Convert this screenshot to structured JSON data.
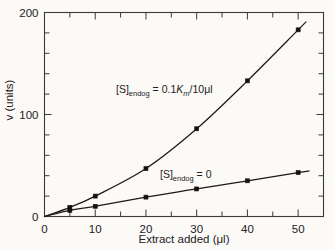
{
  "chart_data": {
    "type": "line",
    "title": "",
    "subtitle": "",
    "xlabel": "Extract added (μl)",
    "ylabel": "v (units)",
    "xlim": [
      0,
      55
    ],
    "ylim": [
      0,
      200
    ],
    "xticks": [
      0,
      10,
      20,
      30,
      40,
      50
    ],
    "xtick_labels": [
      "0",
      "10",
      "20",
      "30",
      "40",
      "50"
    ],
    "x_minor_tick_interval": 5,
    "yticks": [
      0,
      100,
      200
    ],
    "ytick_labels": [
      "0",
      "100",
      "200"
    ],
    "y_minor_tick_interval": 20,
    "grid": false,
    "legend": "none",
    "x": [
      0,
      5,
      10,
      20,
      30,
      40,
      50
    ],
    "series": [
      {
        "name": "[S]endog = 0.1Km/10ul",
        "annotation": "[S]endog = 0.1Km/10μl",
        "values": [
          0,
          9,
          20,
          47,
          86,
          133,
          183
        ],
        "marker": "square",
        "color": "#1c1a18"
      },
      {
        "name": "[S]endog = 0",
        "annotation": "[S]endog = 0",
        "values": [
          0,
          6,
          10,
          19,
          27,
          35,
          43
        ],
        "marker": "square",
        "color": "#1c1a18"
      }
    ],
    "annotations": [
      {
        "id": "upper",
        "prefix": "[S]",
        "subscript": "endog",
        "equals": " = 0.1",
        "italic_symbol": "K",
        "italic_subscript": "m",
        "suffix": "/10μl",
        "x_data": 22,
        "y_data": 117
      },
      {
        "id": "lower",
        "prefix": "[S]",
        "subscript": "endog",
        "equals": " = 0",
        "italic_symbol": "",
        "italic_subscript": "",
        "suffix": "",
        "x_data": 32,
        "y_data": 46
      }
    ],
    "axis_color": "#3c3a38",
    "background": "#fbfaf7"
  }
}
